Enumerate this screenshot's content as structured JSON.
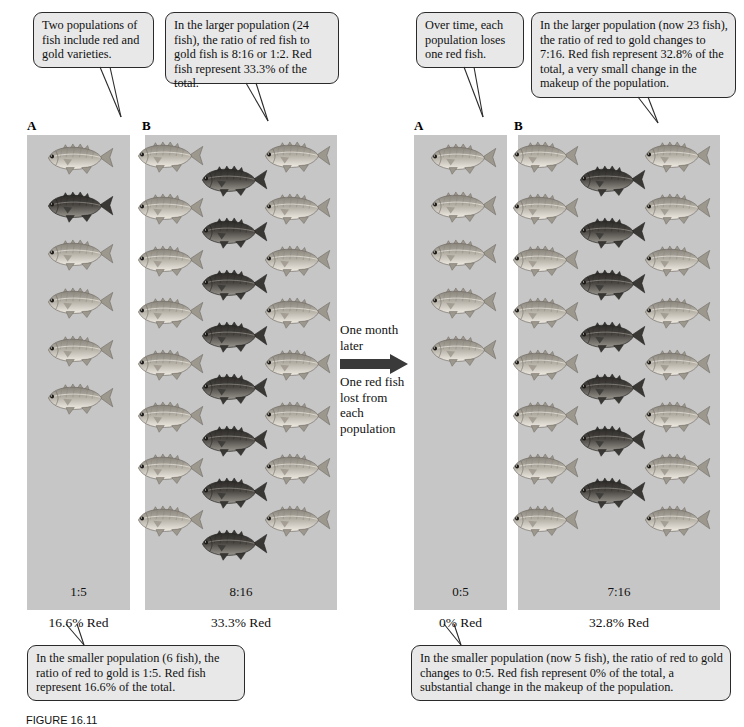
{
  "figure": {
    "caption": "FIGURE 16.11"
  },
  "callouts": [
    {
      "id": "callout-left-a",
      "text": "Two populations of fish include red and gold varieties."
    },
    {
      "id": "callout-left-b",
      "text": "In the larger population (24 fish), the ratio of red fish to gold fish is 8:16 or 1:2. Red fish represent 33.3% of the total."
    },
    {
      "id": "callout-right-a",
      "text": "Over time, each population loses one red fish."
    },
    {
      "id": "callout-right-b",
      "text": "In the larger population (now 23 fish), the ratio of red to gold changes to 7:16. Red fish represent 32.8% of the total, a very small change in the makeup of the population."
    },
    {
      "id": "callout-bottom-left",
      "text": "In the smaller population (6 fish), the ratio of red to gold is 1:5. Red fish represent 16.6% of the total."
    },
    {
      "id": "callout-bottom-right",
      "text": "In the smaller population (now 5 fish), the ratio of red to gold changes to 0:5. Red fish represent 0% of the total, a substantial change in the makeup of the population."
    }
  ],
  "center": {
    "line1": "One month later",
    "line2": "One red fish lost from each population",
    "arrow_icon": "arrow-right-icon"
  },
  "panels": [
    {
      "id": "panel-before-a",
      "letter": "A",
      "ratio": "1:5",
      "percent": "16.6% Red",
      "total_fish": 6,
      "red_count": 1,
      "gold_count": 5,
      "layout": "single-column",
      "red_indices": [
        1
      ]
    },
    {
      "id": "panel-before-b",
      "letter": "B",
      "ratio": "8:16",
      "percent": "33.3% Red",
      "total_fish": 24,
      "red_count": 8,
      "gold_count": 16,
      "layout": "three-column-staggered",
      "left_column_count": 8,
      "center_column_count": 8,
      "right_column_count": 8
    },
    {
      "id": "panel-after-a",
      "letter": "A",
      "ratio": "0:5",
      "percent": "0% Red",
      "total_fish": 5,
      "red_count": 0,
      "gold_count": 5,
      "layout": "single-column",
      "red_indices": []
    },
    {
      "id": "panel-after-b",
      "letter": "B",
      "ratio": "7:16",
      "percent": "32.8% Red",
      "total_fish": 23,
      "red_count": 7,
      "gold_count": 16,
      "layout": "three-column-staggered",
      "left_column_count": 8,
      "center_column_count": 7,
      "right_column_count": 8
    }
  ],
  "colors": {
    "panel_background": "#c6c6c6",
    "callout_background": "#e8e8e8",
    "callout_border": "#2a2a2a",
    "gold_fish": "#b9b4ab",
    "red_fish": "#5d5a56",
    "page_background": "#ffffff"
  },
  "fish_legend": {
    "gold_label": "gold fish",
    "red_label": "red fish"
  }
}
